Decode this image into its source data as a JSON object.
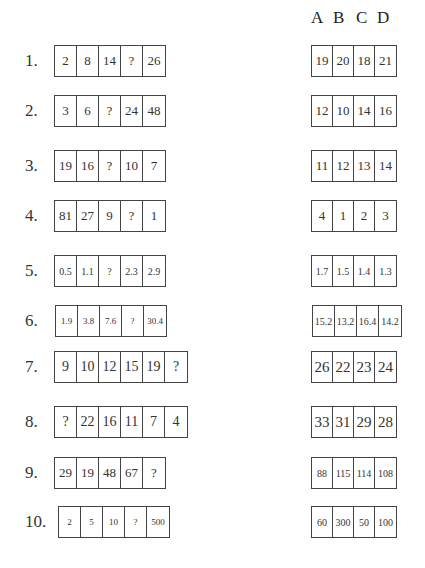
{
  "header": {
    "options": [
      "A",
      "B",
      "C",
      "D"
    ]
  },
  "questions": [
    {
      "number": "1.",
      "sequence": [
        "2",
        "8",
        "14",
        "?",
        "26"
      ],
      "answers": [
        "19",
        "20",
        "18",
        "21"
      ]
    },
    {
      "number": "2.",
      "sequence": [
        "3",
        "6",
        "?",
        "24",
        "48"
      ],
      "answers": [
        "12",
        "10",
        "14",
        "16"
      ]
    },
    {
      "number": "3.",
      "sequence": [
        "19",
        "16",
        "?",
        "10",
        "7"
      ],
      "answers": [
        "11",
        "12",
        "13",
        "14"
      ]
    },
    {
      "number": "4.",
      "sequence": [
        "81",
        "27",
        "9",
        "?",
        "1"
      ],
      "answers": [
        "4",
        "1",
        "2",
        "3"
      ]
    },
    {
      "number": "5.",
      "sequence": [
        "0.5",
        "1.1",
        "?",
        "2.3",
        "2.9"
      ],
      "answers": [
        "1.7",
        "1.5",
        "1.4",
        "1.3"
      ]
    },
    {
      "number": "6.",
      "sequence": [
        "1.9",
        "3.8",
        "7.6",
        "?",
        "30.4"
      ],
      "answers": [
        "15.2",
        "13.2",
        "16.4",
        "14.2"
      ]
    },
    {
      "number": "7.",
      "sequence": [
        "9",
        "10",
        "12",
        "15",
        "19",
        "?"
      ],
      "answers": [
        "26",
        "22",
        "23",
        "24"
      ]
    },
    {
      "number": "8.",
      "sequence": [
        "?",
        "22",
        "16",
        "11",
        "7",
        "4"
      ],
      "answers": [
        "33",
        "31",
        "29",
        "28"
      ]
    },
    {
      "number": "9.",
      "sequence": [
        "29",
        "19",
        "48",
        "67",
        "?"
      ],
      "answers": [
        "88",
        "115",
        "114",
        "108"
      ]
    },
    {
      "number": "10.",
      "sequence": [
        "2",
        "5",
        "10",
        "?",
        "500"
      ],
      "answers": [
        "60",
        "300",
        "50",
        "100"
      ]
    }
  ]
}
